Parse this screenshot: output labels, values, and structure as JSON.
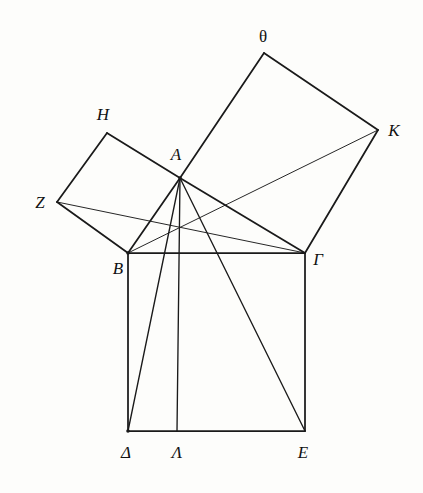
{
  "figure": {
    "background_color": "#fdfdfb",
    "ink_color": "#1a1a1a"
  },
  "points": {
    "A": {
      "label": "A",
      "x": 180,
      "y": 178,
      "label_x": 176,
      "label_y": 160,
      "anchor": "middle",
      "style": "italic"
    },
    "B": {
      "label": "B",
      "x": 128,
      "y": 253,
      "label_x": 118,
      "label_y": 274,
      "anchor": "middle",
      "style": "italic"
    },
    "Gamma": {
      "label": "Γ",
      "x": 305,
      "y": 253,
      "label_x": 318,
      "label_y": 265,
      "anchor": "middle",
      "style": "italic"
    },
    "Delta": {
      "label": "Δ",
      "x": 128,
      "y": 431,
      "label_x": 126,
      "label_y": 458,
      "anchor": "middle",
      "style": "italic"
    },
    "E": {
      "label": "E",
      "x": 305,
      "y": 431,
      "label_x": 303,
      "label_y": 458,
      "anchor": "middle",
      "style": "italic"
    },
    "Lambda": {
      "label": "Λ",
      "x": 177,
      "y": 431,
      "label_x": 177,
      "label_y": 458,
      "anchor": "middle",
      "style": "italic"
    },
    "Z": {
      "label": "Z",
      "x": 57,
      "y": 202,
      "label_x": 40,
      "label_y": 208,
      "anchor": "middle",
      "style": "italic"
    },
    "H": {
      "label": "H",
      "x": 107,
      "y": 133,
      "label_x": 103,
      "label_y": 120,
      "anchor": "middle",
      "style": "italic"
    },
    "Theta": {
      "label": "θ",
      "x": 264,
      "y": 53,
      "label_x": 263,
      "label_y": 42,
      "anchor": "middle",
      "style": "upright"
    },
    "K": {
      "label": "K",
      "x": 378,
      "y": 130,
      "label_x": 394,
      "label_y": 136,
      "anchor": "middle",
      "style": "italic"
    }
  },
  "segments": [
    {
      "name": "side-AB",
      "from": "A",
      "to": "B",
      "weight": "thick"
    },
    {
      "name": "side-A-Gamma",
      "from": "A",
      "to": "Gamma",
      "weight": "thick"
    },
    {
      "name": "side-B-Gamma",
      "from": "B",
      "to": "Gamma",
      "weight": "thick"
    },
    {
      "name": "square-B-Delta",
      "from": "B",
      "to": "Delta",
      "weight": "thick"
    },
    {
      "name": "square-Delta-E",
      "from": "Delta",
      "to": "E",
      "weight": "thick"
    },
    {
      "name": "square-E-Gamma",
      "from": "E",
      "to": "Gamma",
      "weight": "thick"
    },
    {
      "name": "square-A-H",
      "from": "A",
      "to": "H",
      "weight": "thick"
    },
    {
      "name": "square-H-Z",
      "from": "H",
      "to": "Z",
      "weight": "thick"
    },
    {
      "name": "square-Z-B",
      "from": "Z",
      "to": "B",
      "weight": "thick"
    },
    {
      "name": "square-A-Theta",
      "from": "A",
      "to": "Theta",
      "weight": "thick"
    },
    {
      "name": "square-Theta-K",
      "from": "Theta",
      "to": "K",
      "weight": "thick"
    },
    {
      "name": "square-K-Gamma",
      "from": "K",
      "to": "Gamma",
      "weight": "thick"
    },
    {
      "name": "altitude-A-Lambda",
      "from": "A",
      "to": "Lambda",
      "weight": "med"
    },
    {
      "name": "cevian-A-Delta",
      "from": "A",
      "to": "Delta",
      "weight": "med"
    },
    {
      "name": "cevian-A-E",
      "from": "A",
      "to": "E",
      "weight": "med"
    },
    {
      "name": "diagonal-Z-Gamma",
      "from": "Z",
      "to": "Gamma",
      "weight": "thin"
    },
    {
      "name": "diagonal-B-K",
      "from": "B",
      "to": "K",
      "weight": "thin"
    }
  ],
  "vertex_dots": [
    "A",
    "B",
    "Delta"
  ]
}
